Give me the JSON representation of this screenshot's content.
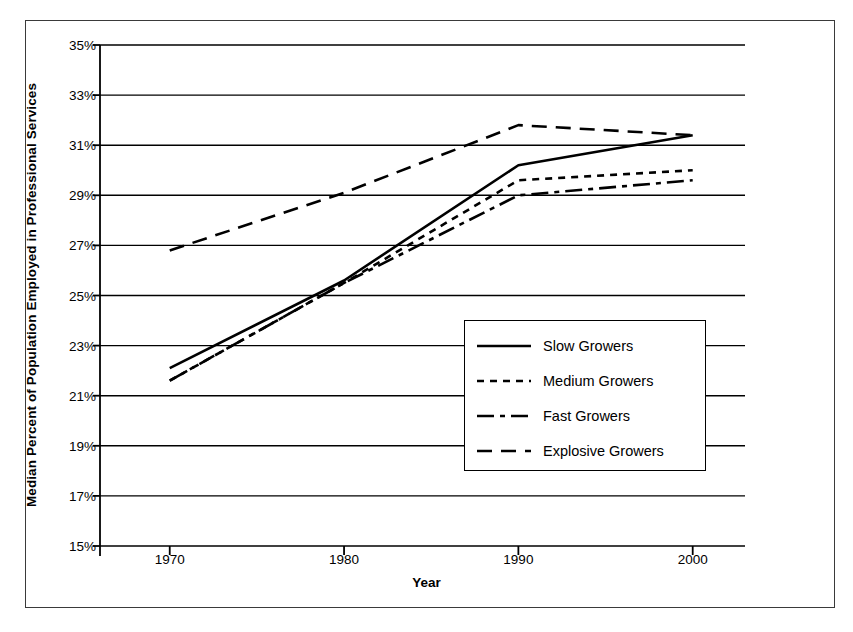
{
  "chart_data": {
    "type": "line",
    "title": "",
    "xlabel": "Year",
    "ylabel": "Median Percent of Population Employed in Professional Services",
    "x": [
      1970,
      1980,
      1990,
      2000
    ],
    "xlim": [
      1966,
      2003
    ],
    "ylim": [
      15,
      35
    ],
    "xticks": [
      "1970",
      "1980",
      "1990",
      "2000"
    ],
    "yticks": [
      "35%",
      "33%",
      "31%",
      "29%",
      "27%",
      "25%",
      "23%",
      "21%",
      "19%",
      "17%",
      "15%"
    ],
    "ytick_values": [
      35,
      33,
      31,
      29,
      27,
      25,
      23,
      21,
      19,
      17,
      15
    ],
    "grid": "horizontal",
    "legend_position": "center-right",
    "series": [
      {
        "name": "Slow Growers",
        "style": "solid",
        "x": [
          1970,
          1980,
          1990,
          2000
        ],
        "values": [
          22.1,
          25.6,
          30.2,
          31.4
        ]
      },
      {
        "name": "Medium Growers",
        "style": "dotted",
        "x": [
          1970,
          1980,
          1990,
          2000
        ],
        "values": [
          21.6,
          25.5,
          29.6,
          30.0
        ]
      },
      {
        "name": "Fast Growers",
        "style": "dash-dot",
        "x": [
          1970,
          1980,
          1990,
          2000
        ],
        "values": [
          21.6,
          25.5,
          29.0,
          29.6
        ]
      },
      {
        "name": "Explosive Growers",
        "style": "dashed",
        "x": [
          1970,
          1980,
          1990,
          2000
        ],
        "values": [
          26.8,
          29.1,
          31.8,
          31.4
        ]
      }
    ]
  },
  "legend": {
    "entries": [
      {
        "label": "Slow Growers"
      },
      {
        "label": "Medium Growers"
      },
      {
        "label": "Fast Growers"
      },
      {
        "label": "Explosive Growers"
      }
    ]
  }
}
